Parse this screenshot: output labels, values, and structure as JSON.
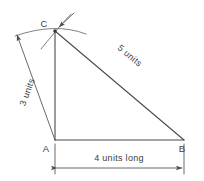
{
  "figure": {
    "background_color": "#ffffff",
    "line_color": "#4a4a4a",
    "text_color": "#3d3d3d",
    "vertices": [
      {
        "name": "A",
        "label": "A",
        "x": 55,
        "y": 140,
        "label_x": 48,
        "label_y": 150
      },
      {
        "name": "B",
        "label": "B",
        "x": 184,
        "y": 140,
        "label_x": 180,
        "label_y": 150
      },
      {
        "name": "C",
        "label": "C",
        "x": 55,
        "y": 31,
        "label_x": 42,
        "label_y": 26
      }
    ],
    "sides": [
      {
        "name": "base-AB",
        "from": "A",
        "to": "B",
        "label": "4 units long",
        "length": 4
      },
      {
        "name": "vertical-AC",
        "from": "A",
        "to": "C",
        "label": "3 units",
        "length": 3
      },
      {
        "name": "hypotenuse-CB",
        "from": "C",
        "to": "B",
        "label": "5 units",
        "length": 5
      }
    ],
    "dimensions": {
      "base": {
        "text": "4 units long",
        "text_x": 118,
        "text_y": 160,
        "line_y": 168,
        "x1": 55,
        "x2": 184
      },
      "left": {
        "text": "3 units",
        "text_x": 27,
        "text_y": 90,
        "rotation": -73
      },
      "hypotenuse": {
        "text": "5 units",
        "text_x": 126,
        "text_y": 60,
        "rotation": 40
      }
    },
    "units_label": "units"
  }
}
